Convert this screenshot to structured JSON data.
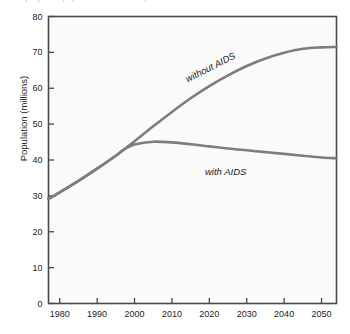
{
  "figure": {
    "clipped_title": "projected population of a country with and without AIDS",
    "background_color": "#ffffff",
    "plot_background_color": "#fafafa",
    "frame_color": "#4a4a4a",
    "curve_color": "#7d7d7d"
  },
  "chart_data": {
    "type": "line",
    "title": "",
    "xlabel": "",
    "ylabel": "Population (millions)",
    "xlim": [
      1977,
      2054
    ],
    "ylim": [
      0,
      80
    ],
    "grid": false,
    "legend": "none (curves labeled inline)",
    "xticks": [
      "1980",
      "1990",
      "2000",
      "2010",
      "2020",
      "2030",
      "2040",
      "2050"
    ],
    "xtick_values": [
      1980,
      1990,
      2000,
      2010,
      2020,
      2030,
      2040,
      2050
    ],
    "yticks": [
      "0",
      "10",
      "20",
      "30",
      "40",
      "50",
      "60",
      "70",
      "80"
    ],
    "ytick_values": [
      0,
      10,
      20,
      30,
      40,
      50,
      60,
      70,
      80
    ],
    "x": [
      1977,
      1980,
      1985,
      1990,
      1995,
      1997,
      2000,
      2005,
      2010,
      2015,
      2020,
      2025,
      2030,
      2035,
      2040,
      2045,
      2050,
      2054
    ],
    "series": [
      {
        "name": "without AIDS",
        "label": "without AIDS",
        "color": "#7d7d7d",
        "values": [
          29.2,
          31.0,
          34.2,
          37.6,
          41.2,
          42.8,
          45.2,
          49.4,
          53.4,
          57.2,
          60.6,
          63.6,
          66.2,
          68.3,
          69.9,
          71.0,
          71.4,
          71.5
        ]
      },
      {
        "name": "with AIDS",
        "label": "with AIDS",
        "color": "#7d7d7d",
        "values": [
          29.2,
          31.0,
          34.2,
          37.6,
          41.2,
          42.8,
          44.3,
          45.1,
          44.9,
          44.4,
          43.8,
          43.2,
          42.7,
          42.2,
          41.7,
          41.2,
          40.7,
          40.5
        ]
      }
    ],
    "annotations": [
      {
        "text": "without AIDS",
        "x": 2017,
        "y": 62,
        "rotation": -27
      },
      {
        "text": "with AIDS",
        "x": 2024,
        "y": 41.5,
        "rotation": 0
      }
    ]
  }
}
